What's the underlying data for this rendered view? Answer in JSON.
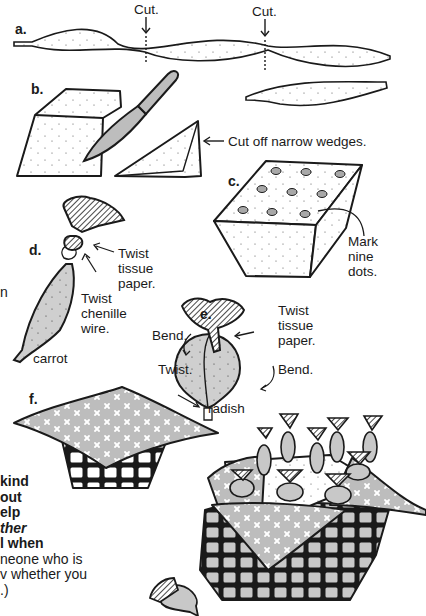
{
  "figure": {
    "type": "craft-instruction-illustration",
    "steps": {
      "a": {
        "label": "a.",
        "annotations": [
          "Cut.",
          "Cut."
        ]
      },
      "b": {
        "label": "b.",
        "annotations": [
          "Cut off narrow wedges."
        ]
      },
      "c": {
        "label": "c.",
        "annotations": [
          "Mark",
          "nine",
          "dots."
        ]
      },
      "d": {
        "label": "d.",
        "annotations": [
          "Twist",
          "tissue",
          "paper.",
          "Twist",
          "chenille",
          "wire."
        ],
        "caption": "carrot"
      },
      "e": {
        "label": "e.",
        "annotations": [
          "Twist",
          "tissue",
          "paper.",
          "Bend.",
          "Bend.",
          "Twist."
        ],
        "caption": "radish"
      },
      "f": {
        "label": "f."
      }
    }
  },
  "side_text": {
    "lines": [
      {
        "text": "kind",
        "style": "bold"
      },
      {
        "text": "out",
        "style": "bold"
      },
      {
        "text": "elp",
        "style": "bold"
      },
      {
        "text": "ther",
        "style": "bold-italic"
      },
      {
        "text": "l when",
        "style": "bold"
      },
      {
        "text": "neone who is",
        "style": "regular"
      },
      {
        "text": "v whether you",
        "style": "regular"
      },
      {
        "text": ".)",
        "style": "regular"
      }
    ],
    "clipped_fragment": "n"
  },
  "colors": {
    "ink": "#1a1a1a",
    "fill_gray": "#c8c8c8",
    "paper": "#ffffff"
  }
}
